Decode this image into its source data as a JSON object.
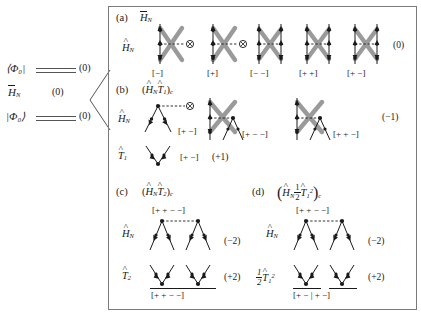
{
  "figure": {
    "background": "#ffffff",
    "frame_color": "#7a7a7a",
    "line_color": "#1a1a1a",
    "blob_color": "#9a9a9a"
  },
  "left_block": {
    "bra_label": "⟨Φ₀|",
    "ket_label": "|Φ₀⟩",
    "operator_label": "H̄_N",
    "bra_value": "(0)",
    "ket_value": "(0)",
    "operator_value": "(0)"
  },
  "panels": [
    {
      "letter": "(a)",
      "header": "H̄_N",
      "rows": [
        {
          "operator": "Ĥ_N",
          "result": "(0)",
          "diagrams": [
            {
              "kind": "one-line-x",
              "label": "[−]"
            },
            {
              "kind": "one-line-x",
              "label": "[+]"
            },
            {
              "kind": "two-line-x",
              "label": "[− −]"
            },
            {
              "kind": "two-line-x",
              "label": "[+ +]"
            },
            {
              "kind": "two-line-x",
              "label": "[+ −]"
            }
          ]
        }
      ]
    },
    {
      "letter": "(b)",
      "header": "(Ĥ_N T̂₁)_c",
      "rows": [
        {
          "operator": "Ĥ_N",
          "result": "(−1)",
          "diagrams": [
            {
              "kind": "vertex-dashed",
              "label": "[+ −]"
            },
            {
              "kind": "x-vertex",
              "label": "[+ − −]"
            },
            {
              "kind": "x-vertex",
              "label": "[+ + −]"
            }
          ]
        },
        {
          "operator": "T̂₁",
          "result": "(+1)",
          "diagrams": [
            {
              "kind": "vee",
              "label": "[+ −]"
            }
          ]
        }
      ]
    },
    {
      "letter": "(c)",
      "header": "(Ĥ_N T̂₂)_c",
      "top_label": "[+ + − −]",
      "bottom_label": "[+ + − −]",
      "rows": [
        {
          "operator": "Ĥ_N",
          "result": "(−2)"
        },
        {
          "operator": "T̂₂",
          "result": "(+2)"
        }
      ]
    },
    {
      "letter": "(d)",
      "header": "(Ĥ_N ½ T̂₁²)_c",
      "top_label": "[+ + − −]",
      "bottom_label": "[+ − | + −]",
      "rows": [
        {
          "operator": "Ĥ_N",
          "result": "(−2)"
        },
        {
          "operator": "½ T̂₁²",
          "result": "(+2)"
        }
      ]
    }
  ],
  "labels": {
    "a_bracket_1": "[−]",
    "a_bracket_2": "[+]",
    "a_bracket_3": "[− −]",
    "a_bracket_4": "[+ +]",
    "a_bracket_5": "[+ −]",
    "a_result": "(0)",
    "b_bracket_1": "[+ −]",
    "b_bracket_2": "[+ − −]",
    "b_bracket_3": "[+ + −]",
    "b_result": "(−1)",
    "b_t1_bracket": "[+ −]",
    "b_t1_result": "(+1)",
    "c_top": "[+ + − −]",
    "c_bottom": "[+ + − −]",
    "c_h_result": "(−2)",
    "c_t_result": "(+2)",
    "d_top": "[+ + − −]",
    "d_bottom": "[+ − | + −]",
    "d_h_result": "(−2)",
    "d_t_result": "(+2)",
    "letter_a": "(a)",
    "letter_b": "(b)",
    "letter_c": "(c)",
    "letter_d": "(d)",
    "bra": "⟨Φ₀|",
    "ket": "|Φ₀⟩",
    "left_bra_value": "(0)",
    "left_ket_value": "(0)",
    "left_op_value": "(0)"
  }
}
